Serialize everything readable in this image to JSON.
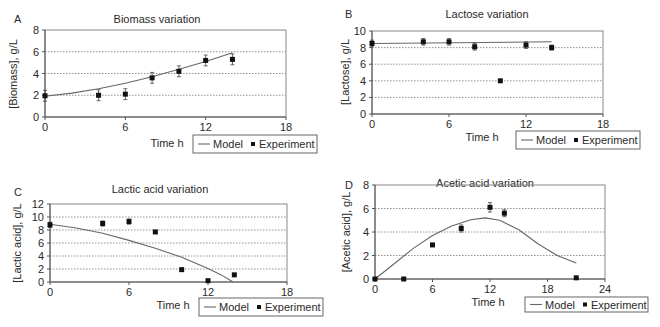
{
  "figure": {
    "legend": {
      "model_label": "Model",
      "experiment_label": "Experiment"
    },
    "xlabel": "Time h"
  },
  "chart_data": [
    {
      "panel": "A",
      "type": "scatter",
      "title": "Biomass variation",
      "xlabel": "Time h",
      "ylabel": "[Biomass], g/L",
      "xlim": [
        0,
        18
      ],
      "xticks": [
        0,
        6,
        12,
        18
      ],
      "ylim": [
        0,
        8
      ],
      "yticks": [
        0,
        2,
        4,
        6,
        8
      ],
      "grid": "dotted horizontal",
      "legend_position": "below-right",
      "series": [
        {
          "name": "Model",
          "kind": "line",
          "x": [
            0,
            2,
            4,
            6,
            8,
            10,
            12,
            14
          ],
          "y": [
            1.9,
            2.2,
            2.6,
            3.1,
            3.7,
            4.4,
            5.1,
            5.9
          ]
        },
        {
          "name": "Experiment",
          "kind": "marker",
          "x": [
            0,
            4,
            6,
            8,
            10,
            12,
            14
          ],
          "y": [
            1.95,
            2.0,
            2.1,
            3.6,
            4.2,
            5.2,
            5.3
          ],
          "err": [
            0.5,
            0.5,
            0.5,
            0.5,
            0.5,
            0.5,
            0.5
          ]
        }
      ]
    },
    {
      "panel": "B",
      "type": "scatter",
      "title": "Lactose variation",
      "xlabel": "Time h",
      "ylabel": "[Lactose], g/L",
      "xlim": [
        0,
        18
      ],
      "xticks": [
        0,
        6,
        12,
        18
      ],
      "ylim": [
        0,
        10
      ],
      "yticks": [
        0,
        2,
        4,
        6,
        8,
        10
      ],
      "grid": "dotted horizontal",
      "legend_position": "below-right",
      "series": [
        {
          "name": "Model",
          "kind": "line",
          "x": [
            0,
            14
          ],
          "y": [
            8.5,
            8.7
          ]
        },
        {
          "name": "Experiment",
          "kind": "marker",
          "x": [
            0,
            4,
            6,
            8,
            10,
            12,
            14
          ],
          "y": [
            8.5,
            8.7,
            8.7,
            8.1,
            4.0,
            8.3,
            8.0
          ],
          "err": [
            0.4,
            0.4,
            0.4,
            0.4,
            0,
            0.4,
            0.3
          ]
        }
      ]
    },
    {
      "panel": "C",
      "type": "scatter",
      "title": "Lactic acid variation",
      "xlabel": "Time h",
      "ylabel": "[Lactic acid], g/L",
      "xlim": [
        0,
        18
      ],
      "xticks": [
        0,
        6,
        12,
        18
      ],
      "ylim": [
        0,
        12
      ],
      "yticks": [
        0,
        2,
        4,
        6,
        8,
        10,
        12
      ],
      "grid": "dotted horizontal",
      "legend_position": "below-right",
      "series": [
        {
          "name": "Model",
          "kind": "line",
          "x": [
            0,
            2,
            4,
            6,
            8,
            10,
            12,
            13,
            13.9
          ],
          "y": [
            8.9,
            8.3,
            7.5,
            6.4,
            5.2,
            3.8,
            2.1,
            1.1,
            0
          ]
        },
        {
          "name": "Experiment",
          "kind": "marker",
          "x": [
            0,
            4,
            6,
            8,
            10,
            12,
            14
          ],
          "y": [
            8.8,
            9.0,
            9.3,
            7.7,
            1.9,
            0.2,
            1.1
          ],
          "err": [
            0.4,
            0.4,
            0.4,
            0.2,
            0,
            0,
            0
          ]
        }
      ]
    },
    {
      "panel": "D",
      "type": "scatter",
      "title": "Acetic acid variation",
      "xlabel": "Time h",
      "ylabel": "[Acetic acid], g/L",
      "xlim": [
        0,
        24
      ],
      "xticks": [
        0,
        6,
        12,
        18,
        24
      ],
      "ylim": [
        0,
        8
      ],
      "yticks": [
        0,
        2,
        4,
        6,
        8
      ],
      "grid": "dotted horizontal",
      "legend_position": "below-right",
      "series": [
        {
          "name": "Model",
          "kind": "line",
          "x": [
            0,
            2,
            4,
            6,
            8,
            10,
            11.5,
            13,
            15,
            17,
            19,
            21
          ],
          "y": [
            0,
            1.3,
            2.6,
            3.7,
            4.5,
            5.05,
            5.2,
            5.0,
            4.2,
            3.0,
            2.0,
            1.35
          ]
        },
        {
          "name": "Experiment",
          "kind": "marker",
          "x": [
            0,
            3,
            6,
            9,
            12,
            13.5,
            21
          ],
          "y": [
            0,
            0,
            2.9,
            4.3,
            6.1,
            5.6,
            0.1
          ],
          "err": [
            0,
            0,
            0,
            0.3,
            0.4,
            0.3,
            0
          ]
        }
      ]
    }
  ],
  "layout": {
    "panels": [
      {
        "label_pos": [
          14,
          23
        ],
        "title_pos": [
          157,
          23
        ],
        "plot": [
          45,
          30,
          286,
          117
        ],
        "xlabel_pos": [
          167,
          147
        ],
        "ylabel_pos": [
          17,
          74
        ],
        "legend_box": [
          193,
          135,
          124,
          18
        ]
      },
      {
        "label_pos": [
          345,
          18
        ],
        "title_pos": [
          487,
          18
        ],
        "plot": [
          372,
          31,
          603,
          114
        ],
        "xlabel_pos": [
          482,
          141
        ],
        "ylabel_pos": [
          349,
          72
        ],
        "legend_box": [
          516,
          131,
          124,
          18
        ]
      },
      {
        "label_pos": [
          14,
          196
        ],
        "title_pos": [
          160,
          193
        ],
        "plot": [
          50,
          204,
          287,
          282
        ],
        "xlabel_pos": [
          173,
          309
        ],
        "ylabel_pos": [
          21,
          243
        ],
        "legend_box": [
          199,
          298,
          124,
          18
        ]
      },
      {
        "label_pos": [
          345,
          189
        ],
        "title_pos": [
          485,
          187
        ],
        "plot": [
          375,
          185,
          605,
          279
        ],
        "xlabel_pos": [
          488,
          306
        ],
        "ylabel_pos": [
          350,
          232
        ],
        "legend_box": [
          525,
          297,
          123,
          15
        ]
      }
    ],
    "colors": {
      "line": "#666666",
      "marker": "#111111",
      "grid": "#777777",
      "axis": "#888888"
    }
  }
}
